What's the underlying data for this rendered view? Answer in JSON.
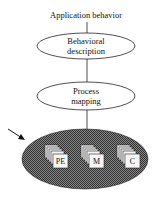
{
  "diagram": {
    "top_label": "Application behavior",
    "nodes": [
      {
        "id": "behavioral",
        "line1": "Behavioral",
        "line2": "description"
      },
      {
        "id": "process",
        "line1": "Process",
        "line2": "mapping"
      }
    ],
    "hardware": {
      "stacks": [
        {
          "label": "PE"
        },
        {
          "label": "M"
        },
        {
          "label": "C"
        }
      ]
    },
    "colors": {
      "line": "#222222",
      "hatch_dark": "#3a3a3a",
      "hatch_light": "#9a9a9a",
      "box_fill": "#f4f4f4"
    }
  }
}
